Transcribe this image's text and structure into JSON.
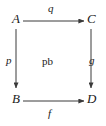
{
  "diagram": {
    "type": "commutative-square",
    "annotation": "pb",
    "nodes": [
      {
        "id": "A",
        "label": "A",
        "position": "top-left"
      },
      {
        "id": "C",
        "label": "C",
        "position": "top-right"
      },
      {
        "id": "B",
        "label": "B",
        "position": "bottom-left"
      },
      {
        "id": "D",
        "label": "D",
        "position": "bottom-right"
      }
    ],
    "edges": [
      {
        "id": "q",
        "label": "q",
        "from": "A",
        "to": "C",
        "direction": "right",
        "label_position": "above"
      },
      {
        "id": "p",
        "label": "p",
        "from": "A",
        "to": "B",
        "direction": "down",
        "label_position": "left"
      },
      {
        "id": "g",
        "label": "g",
        "from": "C",
        "to": "D",
        "direction": "down",
        "label_position": "right"
      },
      {
        "id": "f",
        "label": "f",
        "from": "B",
        "to": "D",
        "direction": "right",
        "label_position": "below"
      }
    ],
    "colors": {
      "background": "#ffffff",
      "ink": "#1a1a1a",
      "arrow": "#3a3a3a"
    }
  }
}
